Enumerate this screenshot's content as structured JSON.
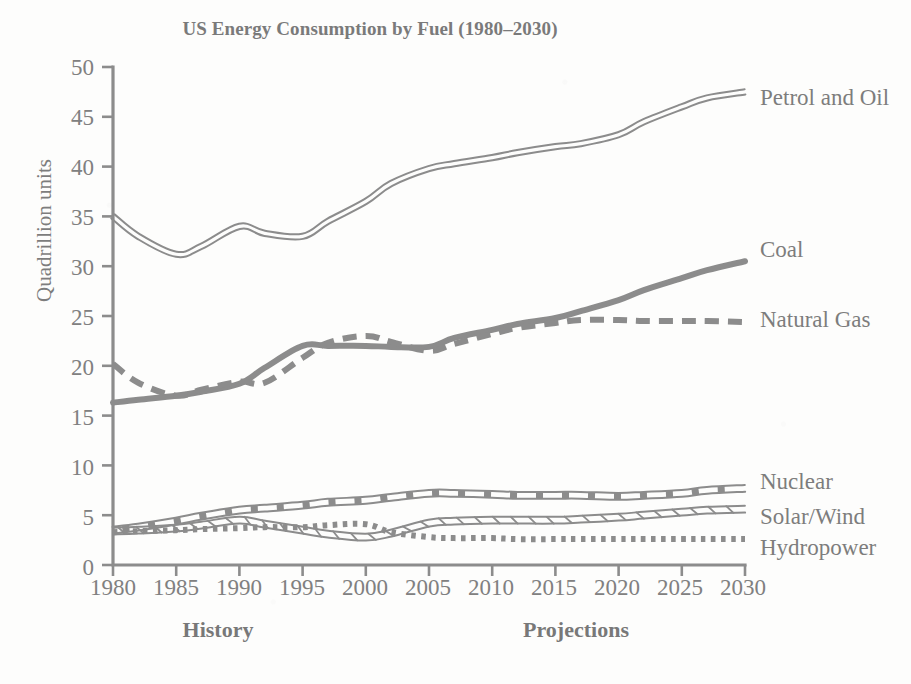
{
  "chart_data": {
    "type": "line",
    "title": "US Energy Consumption by Fuel (1980–2030)",
    "xlabel": "",
    "ylabel": "Quadrillion units",
    "xlim": [
      1980,
      2030
    ],
    "ylim": [
      0,
      50
    ],
    "grid": false,
    "legend_position": "right-inline-labels",
    "x_ticks": [
      "1980",
      "1985",
      "1990",
      "1995",
      "2000",
      "2005",
      "2010",
      "2015",
      "2020",
      "2025",
      "2030"
    ],
    "y_ticks": [
      "0",
      "5",
      "10",
      "15",
      "20",
      "25",
      "30",
      "35",
      "40",
      "45",
      "50"
    ],
    "annotations": [
      {
        "text": "History",
        "region": "1980-2005"
      },
      {
        "text": "Projections",
        "region": "2005-2030"
      }
    ],
    "x": [
      1980,
      1982,
      1985,
      1987,
      1990,
      1992,
      1995,
      1997,
      2000,
      2002,
      2005,
      2007,
      2010,
      2012,
      2015,
      2017,
      2020,
      2022,
      2025,
      2027,
      2030
    ],
    "series": [
      {
        "name": "Petrol and Oil",
        "style": "double-line",
        "color": "#8c8c8c",
        "values": [
          35.0,
          33.0,
          31.2,
          32.0,
          34.0,
          33.3,
          33.0,
          34.5,
          36.5,
          38.3,
          39.8,
          40.3,
          40.9,
          41.4,
          42.0,
          42.3,
          43.2,
          44.5,
          46.0,
          46.9,
          47.5
        ]
      },
      {
        "name": "Coal",
        "style": "solid-thick",
        "color": "#8c8c8c",
        "values": [
          16.3,
          16.6,
          17.0,
          17.4,
          18.2,
          19.8,
          22.0,
          22.0,
          22.0,
          21.9,
          21.9,
          22.8,
          23.6,
          24.2,
          24.8,
          25.5,
          26.6,
          27.6,
          28.8,
          29.6,
          30.5
        ]
      },
      {
        "name": "Natural Gas",
        "style": "dashed-thick",
        "color": "#8c8c8c",
        "values": [
          20.2,
          18.3,
          17.0,
          17.6,
          18.4,
          18.3,
          20.8,
          22.3,
          23.0,
          22.4,
          21.5,
          22.2,
          23.2,
          23.8,
          24.3,
          24.6,
          24.6,
          24.5,
          24.5,
          24.5,
          24.4
        ]
      },
      {
        "name": "Nuclear",
        "style": "double-line-dashed",
        "color": "#8c8c8c",
        "values": [
          3.5,
          3.8,
          4.4,
          4.9,
          5.5,
          5.7,
          6.0,
          6.3,
          6.5,
          6.8,
          7.2,
          7.2,
          7.1,
          7.0,
          7.0,
          7.0,
          6.9,
          7.0,
          7.2,
          7.5,
          7.7
        ]
      },
      {
        "name": "Solar/Wind",
        "style": "double-line-hatched",
        "color": "#8c8c8c",
        "values": [
          3.4,
          3.5,
          3.7,
          4.0,
          4.5,
          4.1,
          3.5,
          3.1,
          2.8,
          3.2,
          4.2,
          4.4,
          4.5,
          4.5,
          4.5,
          4.6,
          4.8,
          5.0,
          5.3,
          5.5,
          5.6
        ]
      },
      {
        "name": "Hydropower",
        "style": "dotted-thick",
        "color": "#8c8c8c",
        "values": [
          3.3,
          3.4,
          3.5,
          3.6,
          3.7,
          3.8,
          3.8,
          4.0,
          4.1,
          3.3,
          2.8,
          2.7,
          2.7,
          2.6,
          2.6,
          2.6,
          2.6,
          2.6,
          2.6,
          2.6,
          2.6
        ]
      }
    ]
  },
  "labels": {
    "petrol_and_oil": "Petrol and Oil",
    "coal": "Coal",
    "natural_gas": "Natural Gas",
    "nuclear": "Nuclear",
    "solar_wind": "Solar/Wind",
    "hydropower": "Hydropower",
    "history": "History",
    "projections": "Projections"
  },
  "axis": {
    "y_title": "Quadrillion units",
    "y0": "0",
    "y5": "5",
    "y10": "10",
    "y15": "15",
    "y20": "20",
    "y25": "25",
    "y30": "30",
    "y35": "35",
    "y40": "40",
    "y45": "45",
    "y50": "50",
    "x1980": "1980",
    "x1985": "1985",
    "x1990": "1990",
    "x1995": "1995",
    "x2000": "2000",
    "x2005": "2005",
    "x2010": "2010",
    "x2015": "2015",
    "x2020": "2020",
    "x2025": "2025",
    "x2030": "2030"
  },
  "colors": {
    "line": "#8c8c8c",
    "text": "#7d7d7d",
    "background": "#fdfdfc"
  }
}
